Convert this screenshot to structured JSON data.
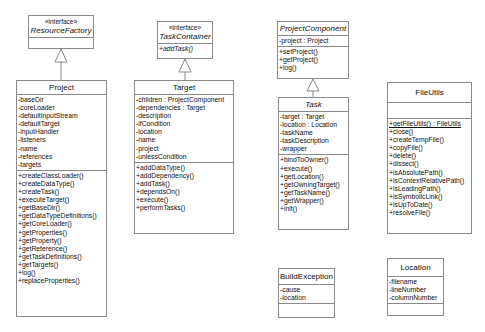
{
  "classes": {
    "resource_factory": {
      "stereotype": "«interface»",
      "name": "ResourceFactory",
      "attributes": [],
      "operations": []
    },
    "task_container": {
      "stereotype": "«interface»",
      "name": "TaskContainer",
      "operations": [
        "+addTask()"
      ]
    },
    "project_component": {
      "name": "ProjectComponent",
      "attributes": [
        "-project : Project"
      ],
      "operations": [
        "+setProject()",
        "+getProject()",
        "+log()"
      ]
    },
    "project": {
      "name": "Project",
      "attributes": [
        "-baseDir",
        "-coreLoader",
        "-defaultInputStream",
        "-defaultTarget",
        "-inputHandler",
        "-listeners",
        "-name",
        "-references",
        "-targets"
      ],
      "operations": [
        "+createClassLoader()",
        "+createDataType()",
        "+createTask()",
        "+executeTarget()",
        "+getBaseDir()",
        "+getDataTypeDefinitions()",
        "+getCoreLoader()",
        "+getProperties()",
        "+getProperty()",
        "+getReference()",
        "+getTaskDefinitions()",
        "+getTargets()",
        "+log()",
        "+replaceProperties()"
      ]
    },
    "target": {
      "name": "Target",
      "attributes": [
        "-children : ProjectComponent",
        "-dependencies : Target",
        "-description",
        "-ifCondition",
        "-location",
        "-name",
        "-project",
        "-unlessCondition"
      ],
      "operations": [
        "+addDataType()",
        "+addDependency()",
        "+addTask()",
        "+dependsOn()",
        "+execute()",
        "+performTasks()"
      ]
    },
    "task": {
      "name": "Task",
      "attributes": [
        "-target : Target",
        "-location : Location",
        "-taskName",
        "-taskDescription",
        "-wrapper"
      ],
      "operations": [
        "+bindToOwner()",
        "+execute()",
        "+getLocation()",
        "+getOwningTarget()",
        "+getTaskName()",
        "+getWrapper()",
        "+init()"
      ]
    },
    "file_utils": {
      "name": "FileUtils",
      "attributes": [],
      "operations": [
        "+getFileUtils() : FileUtils",
        "+close()",
        "+createTempFile()",
        "+copyFile()",
        "+delete()",
        "+dissect()",
        "+isAbsolutePath()",
        "+isContextRelativePath()",
        "+isLeadingPath()",
        "+isSymbolicLink()",
        "+isUpToDate()",
        "+resolveFile()"
      ]
    },
    "build_exception": {
      "name": "BuildException",
      "attributes": [
        "-cause",
        "-location"
      ],
      "operations": []
    },
    "location": {
      "name": "Location",
      "attributes": [
        "-filename",
        "-lineNumber",
        "-columnNumber"
      ],
      "operations": []
    }
  },
  "relations": [
    {
      "type": "realization",
      "from": "Project",
      "to": "ResourceFactory"
    },
    {
      "type": "realization",
      "from": "Target",
      "to": "TaskContainer"
    },
    {
      "type": "generalization",
      "from": "Task",
      "to": "ProjectComponent"
    }
  ]
}
